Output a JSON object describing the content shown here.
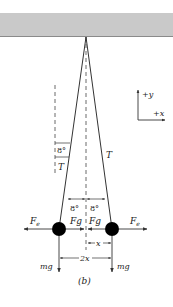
{
  "figure": {
    "caption": "(b)",
    "ceiling_color": "#c9c9c9",
    "line_color": "#333333",
    "ball_color": "#000000"
  },
  "axes": {
    "y_label": "+y",
    "x_label": "+x"
  },
  "angles": {
    "left_top": "8°",
    "middle_left": "8°",
    "middle_right": "8°"
  },
  "tension": {
    "left": "T",
    "right": "T"
  },
  "forces": {
    "left_electric": "F",
    "left_electric_sub": "e",
    "left_gravity": "F",
    "left_gravity_sub": "g",
    "right_gravity": "F",
    "right_gravity_sub": "g",
    "right_electric": "F",
    "right_electric_sub": "e",
    "left_weight": "mg",
    "right_weight": "mg"
  },
  "distances": {
    "half": "x",
    "full": "2x"
  }
}
